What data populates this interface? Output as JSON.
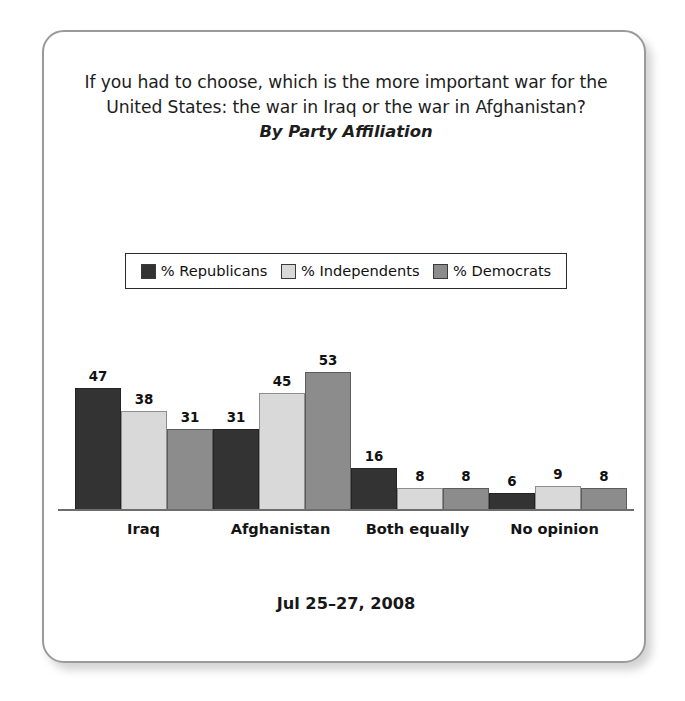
{
  "card": {
    "title": "If you had to choose, which is the more important war for the United States: the war in Iraq or the war in Afghanistan?",
    "subtitle": "By Party Affiliation",
    "footer_date": "Jul 25–27, 2008"
  },
  "legend": {
    "items": [
      {
        "label": "% Republicans",
        "color": "#333333"
      },
      {
        "label": "% Independents",
        "color": "#d9d9d9"
      },
      {
        "label": "% Democrats",
        "color": "#8c8c8c"
      }
    ]
  },
  "chart_data": {
    "type": "bar",
    "title": "If you had to choose, which is the more important war for the United States: the war in Iraq or the war in Afghanistan?",
    "subtitle": "By Party Affiliation",
    "xlabel": "",
    "ylabel": "",
    "ylim": [
      0,
      53
    ],
    "grid": false,
    "legend_position": "top-center",
    "note": "Jul 25–27, 2008",
    "categories": [
      "Iraq",
      "Afghanistan",
      "Both equally",
      "No opinion"
    ],
    "series": [
      {
        "name": "% Republicans",
        "color": "#333333",
        "values": [
          47,
          31,
          16,
          6
        ]
      },
      {
        "name": "% Independents",
        "color": "#d9d9d9",
        "values": [
          38,
          45,
          8,
          9
        ]
      },
      {
        "name": "% Democrats",
        "color": "#8c8c8c",
        "values": [
          31,
          53,
          8,
          8
        ]
      }
    ]
  }
}
